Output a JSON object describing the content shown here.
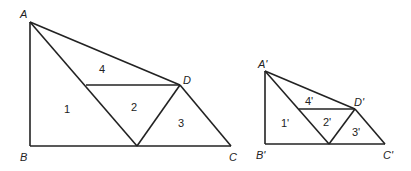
{
  "figures": [
    {
      "name": "large-figure",
      "vertices": {
        "A": {
          "label": "A",
          "x": 30,
          "y": 22
        },
        "B": {
          "label": "B",
          "x": 30,
          "y": 146
        },
        "C": {
          "label": "C",
          "x": 231,
          "y": 146
        },
        "D": {
          "label": "D",
          "x": 180,
          "y": 85
        }
      },
      "regions": [
        "1",
        "2",
        "3",
        "4"
      ]
    },
    {
      "name": "small-figure",
      "vertices": {
        "A": {
          "label": "A'",
          "x": 265,
          "y": 71
        },
        "B": {
          "label": "B'",
          "x": 265,
          "y": 144
        },
        "C": {
          "label": "C'",
          "x": 385,
          "y": 144
        },
        "D": {
          "label": "D'",
          "x": 355,
          "y": 109
        }
      },
      "regions": [
        "1'",
        "2'",
        "3'",
        "4'"
      ]
    }
  ]
}
